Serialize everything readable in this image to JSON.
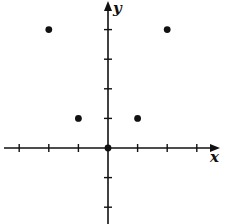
{
  "chart_data": {
    "type": "scatter",
    "title": "",
    "xlabel": "x",
    "ylabel": "y",
    "xlim": [
      -3,
      3
    ],
    "ylim": [
      -3,
      4
    ],
    "grid": false,
    "x_ticks": [
      -3,
      -2,
      -1,
      1,
      2,
      3
    ],
    "y_ticks": [
      -2,
      -1,
      1,
      2,
      3,
      4
    ],
    "tick_labels_shown": false,
    "series": [
      {
        "name": "points",
        "x": [
          -2,
          -1,
          0,
          1,
          2
        ],
        "y": [
          4,
          1,
          0,
          1,
          4
        ]
      }
    ]
  },
  "colors": {
    "ink": "#111111",
    "background": "#ffffff"
  }
}
